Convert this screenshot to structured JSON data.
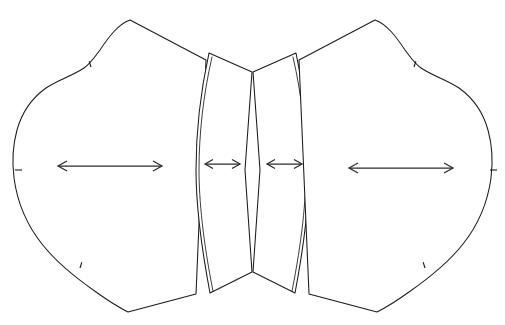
{
  "document": {
    "title": "Pattern Layout Diagram",
    "background_color": "#ffffff",
    "line_color": "#1a1a1a",
    "arrow_color": "#2b2b2b",
    "canvas": {
      "width": 505,
      "height": 325
    }
  },
  "diagram": {
    "type": "sewing-pattern-layout",
    "piece_count": 4,
    "symmetry": "bilateral-vertical-axis",
    "axis_x": 252.5
  },
  "pieces": [
    {
      "id": "left-side-panel",
      "name": "Left Side Panel",
      "kind": "ogee-panel",
      "outline_path": "M 130 20 C 118 24 108 38 100 50 C 94 58 90 64 84 68 C 72 76 58 80 46 88 C 32 98 22 112 17 130 C 12 148 12 162 14 178 C 17 200 26 224 42 244 C 56 262 76 278 96 292 C 110 302 120 308 128 312 L 196 294 L 206 60 Z",
      "has_seam_allowance": false,
      "notches": [
        {
          "x": 91,
          "y": 67,
          "angle": 108,
          "length": 6
        },
        {
          "x": 15,
          "y": 170,
          "angle": 0,
          "length": 7
        },
        {
          "x": 80,
          "y": 268,
          "angle": 72,
          "length": 6
        }
      ],
      "cusps": [
        {
          "x": 130,
          "y": 20
        },
        {
          "x": 128,
          "y": 312
        }
      ]
    },
    {
      "id": "center-left-gore",
      "name": "Center Left Gore",
      "kind": "narrow-gore",
      "outline_path": "M 209 53 L 252 72 L 245 170 L 252 272 L 210 293 C 200 240 196 200 196 170 C 196 134 200 94 209 53 Z",
      "has_seam_allowance": true,
      "seam_path": "M 212 57 C 203 96 199 135 199 170 C 199 200 203 241 213 291",
      "notches": [],
      "cusps": []
    },
    {
      "id": "center-right-gore",
      "name": "Center Right Gore",
      "kind": "narrow-gore",
      "outline_path": "M 296 53 L 253 72 L 260 170 L 253 272 L 295 293 C 305 240 309 200 309 170 C 309 134 305 94 296 53 Z",
      "has_seam_allowance": true,
      "seam_path": "M 293 57 C 302 96 306 135 306 170 C 306 200 302 241 292 291",
      "notches": [],
      "cusps": []
    },
    {
      "id": "right-side-panel",
      "name": "Right Side Panel",
      "kind": "ogee-panel",
      "outline_path": "M 375 20 C 387 24 397 38 405 50 C 411 58 415 64 421 68 C 433 76 447 80 459 88 C 473 98 483 112 488 130 C 493 148 493 162 491 178 C 488 200 479 224 463 244 C 449 262 429 278 409 292 C 395 302 385 308 377 312 L 309 294 L 299 60 Z",
      "has_seam_allowance": false,
      "notches": [
        {
          "x": 414,
          "y": 67,
          "angle": 72,
          "length": 6
        },
        {
          "x": 490,
          "y": 170,
          "angle": 0,
          "length": 7
        },
        {
          "x": 425,
          "y": 268,
          "angle": 108,
          "length": 6
        }
      ],
      "cusps": [
        {
          "x": 375,
          "y": 20
        },
        {
          "x": 377,
          "y": 312
        }
      ]
    }
  ],
  "arrows": [
    {
      "id": "grainline-left",
      "name": "Left Panel Grainline Arrow",
      "orientation": "horizontal",
      "double_headed": true,
      "x1": 58,
      "x2": 162,
      "y": 166,
      "head_length": 9,
      "head_spread": 5,
      "length_px": 104
    },
    {
      "id": "grainline-center-left",
      "name": "Center Left Gore Grainline Arrow",
      "orientation": "horizontal",
      "double_headed": true,
      "x1": 205,
      "x2": 240,
      "y": 164,
      "head_length": 8,
      "head_spread": 4.5,
      "length_px": 35
    },
    {
      "id": "grainline-center-right",
      "name": "Center Right Gore Grainline Arrow",
      "orientation": "horizontal",
      "double_headed": true,
      "x1": 267,
      "x2": 302,
      "y": 164,
      "head_length": 8,
      "head_spread": 4.5,
      "length_px": 35
    },
    {
      "id": "grainline-right",
      "name": "Right Panel Grainline Arrow",
      "orientation": "horizontal",
      "double_headed": true,
      "x1": 349,
      "x2": 453,
      "y": 168,
      "head_length": 9,
      "head_spread": 5,
      "length_px": 104
    }
  ]
}
